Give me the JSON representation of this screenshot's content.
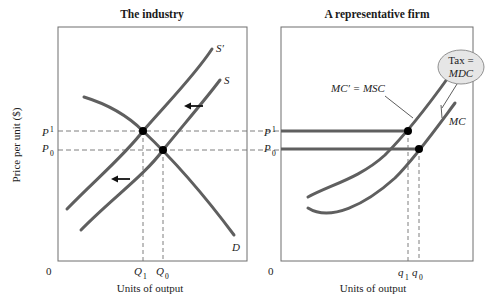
{
  "panels": {
    "left": {
      "title": "The industry",
      "x_label": "Units of output",
      "origin": "0",
      "curves": {
        "demand": "D",
        "supply": "S",
        "supply_shifted": "S′"
      },
      "price_ticks": {
        "p1": "P",
        "p1_sub": "1",
        "p0": "P",
        "p0_sub": "0"
      },
      "qty_ticks": {
        "q1": "Q",
        "q1_sub": "1",
        "q0": "Q",
        "q0_sub": "0"
      },
      "shift_direction": "left"
    },
    "right": {
      "title": "A representative firm",
      "x_label": "Units of output",
      "origin": "0",
      "curves": {
        "mc": "MC",
        "mc_shifted": "MC′ = MSC"
      },
      "tax_bubble": {
        "line1": "Tax =",
        "line2": "MDC"
      },
      "price_ticks": {
        "p1": "P",
        "p1_sub": "1",
        "p0": "P",
        "p0_sub": "0"
      },
      "qty_ticks": {
        "q1": "q",
        "q1_sub": "1",
        "q0": "q",
        "q0_sub": "0"
      }
    }
  },
  "y_axis_label": "Price per unit ($)",
  "colors": {
    "curve": "#5f5f5f",
    "frame": "#6e6e6e",
    "dashed": "#707070",
    "point": "#000000",
    "bubble_fill": "#e6e6e6"
  }
}
